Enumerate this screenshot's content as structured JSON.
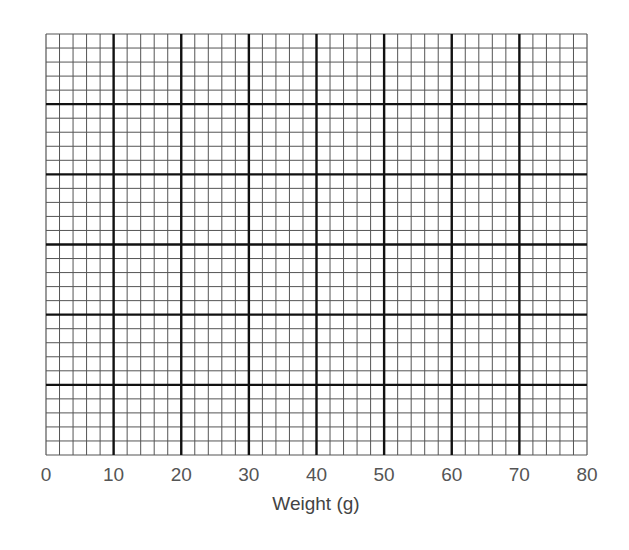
{
  "chart_data": {
    "type": "line",
    "title": "",
    "xlabel": "Weight (g)",
    "ylabel": "",
    "xlim": [
      0,
      80
    ],
    "x_ticks": [
      0,
      10,
      20,
      30,
      40,
      50,
      60,
      70,
      80
    ],
    "x_tick_labels": [
      "0",
      "10",
      "20",
      "30",
      "40",
      "50",
      "60",
      "70",
      "80"
    ],
    "y_ticks": [],
    "grid": {
      "on": true,
      "major_columns": 8,
      "major_rows": 6,
      "minor_per_major": 5,
      "major_color": "#111111",
      "minor_color": "#555555"
    },
    "series": [],
    "legend": null
  },
  "layout": {
    "plot_left": 46,
    "plot_top": 34,
    "plot_right": 587,
    "plot_bottom": 455
  }
}
